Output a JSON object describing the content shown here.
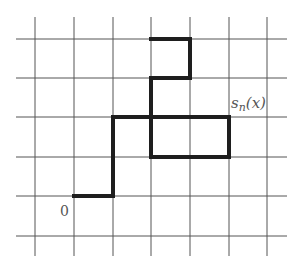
{
  "diagram": {
    "title": "",
    "grid": {
      "x_lines": [
        35,
        74,
        113,
        151,
        190,
        229,
        267
      ],
      "y_lines": [
        39,
        78,
        117,
        157,
        196,
        236
      ],
      "x_extent": [
        16,
        287
      ],
      "y_extent": [
        17,
        256
      ],
      "color": "#555555"
    },
    "path": {
      "color": "#1e1e1e",
      "segments": [
        [
          [
            74,
            196
          ],
          [
            113,
            196
          ]
        ],
        [
          [
            113,
            196
          ],
          [
            113,
            117
          ]
        ],
        [
          [
            113,
            117
          ],
          [
            229,
            117
          ]
        ],
        [
          [
            229,
            117
          ],
          [
            229,
            157
          ]
        ],
        [
          [
            229,
            157
          ],
          [
            151,
            157
          ]
        ],
        [
          [
            151,
            157
          ],
          [
            151,
            78
          ]
        ],
        [
          [
            151,
            78
          ],
          [
            190,
            78
          ]
        ],
        [
          [
            190,
            78
          ],
          [
            190,
            39
          ]
        ],
        [
          [
            190,
            39
          ],
          [
            151,
            39
          ]
        ]
      ]
    },
    "labels": {
      "origin": "0",
      "end_s": "s",
      "end_sub": "n",
      "end_arg": "(x)"
    }
  }
}
